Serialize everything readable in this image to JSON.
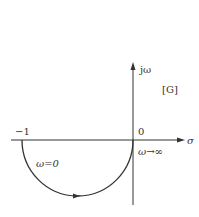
{
  "diagram": {
    "type": "nyquist-plot",
    "plane_label": "[G]",
    "axes": {
      "imag_label": "jω",
      "real_label": "σ",
      "origin_label": "0",
      "minus_one_label": "−1"
    },
    "curve": {
      "shape": "lower semicircle from -1 to 0",
      "start_label": "ω=0",
      "end_label": "ω→∞",
      "direction": "clockwise from -1 through lower half-plane to origin"
    },
    "colors": {
      "stroke": "#333333",
      "background": "#ffffff"
    }
  }
}
